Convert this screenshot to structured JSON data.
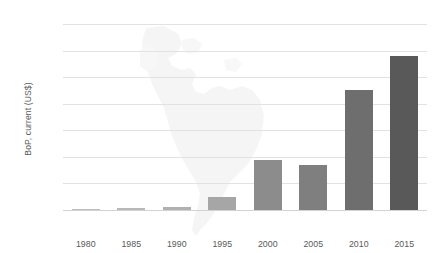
{
  "chart_data": {
    "type": "bar",
    "title": "",
    "xlabel": "",
    "ylabel": "BoP, current (US$)",
    "categories": [
      "1980",
      "1985",
      "1990",
      "1995",
      "2000",
      "2005",
      "2010",
      "2015"
    ],
    "values": [
      1000000000,
      3000000000,
      6000000000,
      25000000000,
      95000000000,
      85000000000,
      225000000000,
      290000000000
    ],
    "bar_colors": [
      "#bdbdbd",
      "#b8b8b8",
      "#b0b0b0",
      "#a6a6a6",
      "#8c8c8c",
      "#7f7f7f",
      "#6e6e6e",
      "#595959"
    ],
    "ylim": [
      0,
      350000000000
    ],
    "ytick_values": [
      0,
      50000000000,
      100000000000,
      150000000000,
      200000000000,
      250000000000,
      300000000000,
      350000000000
    ],
    "ytick_labels": [
      "0",
      "5E+10",
      "1E+11",
      "1.5E+11",
      "2E+11",
      "2.5E+11",
      "3E+11",
      "3.5E+11"
    ],
    "grid": true,
    "legend": "none",
    "background_watermark": "latin-america-map"
  },
  "colors": {
    "gridline": "#e2e2e2",
    "axis_text": "#595959",
    "watermark": "#ededed",
    "background": "#ffffff"
  }
}
